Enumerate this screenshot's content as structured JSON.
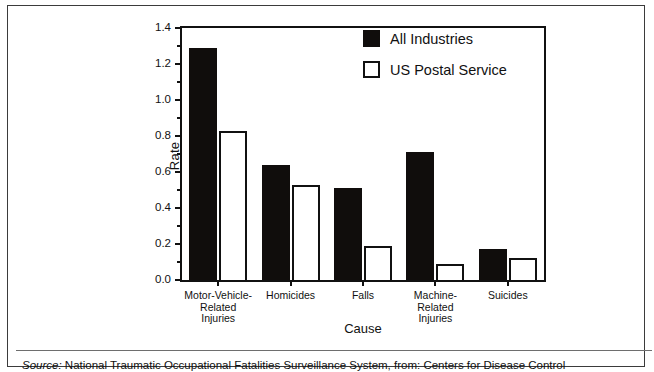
{
  "chart_data": {
    "type": "bar",
    "title": "",
    "xlabel": "Cause",
    "ylabel": "Rate",
    "ylim": [
      0.0,
      1.4
    ],
    "ytick_step": 0.2,
    "yminor_step": 0.1,
    "grid": false,
    "legend_position": "top-right",
    "categories": [
      "Motor-Vehicle-Related Injuries",
      "Homicides",
      "Falls",
      "Machine-Related Injuries",
      "Suicides"
    ],
    "category_label_lines": [
      [
        "Motor-Vehicle-",
        "Related",
        "Injuries"
      ],
      [
        "Homicides"
      ],
      [
        "Falls"
      ],
      [
        "Machine-",
        "Related",
        "Injuries"
      ],
      [
        "Suicides"
      ]
    ],
    "ytick_labels": [
      "0.0",
      "0.2",
      "0.4",
      "0.6",
      "0.8",
      "1.0",
      "1.2",
      "1.4"
    ],
    "ytick_values": [
      0.0,
      0.2,
      0.4,
      0.6,
      0.8,
      1.0,
      1.2,
      1.4
    ],
    "series": [
      {
        "name": "All Industries",
        "color": "#100d0c",
        "style": "filled",
        "values": [
          1.29,
          0.64,
          0.51,
          0.71,
          0.17
        ]
      },
      {
        "name": "US Postal Service",
        "color": "#ffffff",
        "style": "outlined",
        "values": [
          0.83,
          0.53,
          0.19,
          0.09,
          0.12
        ]
      }
    ]
  },
  "caption": {
    "source_word": "Source:",
    "text": "  National Traumatic Occupational Fatalities Surveillance System, from: Centers for Disease Control"
  }
}
